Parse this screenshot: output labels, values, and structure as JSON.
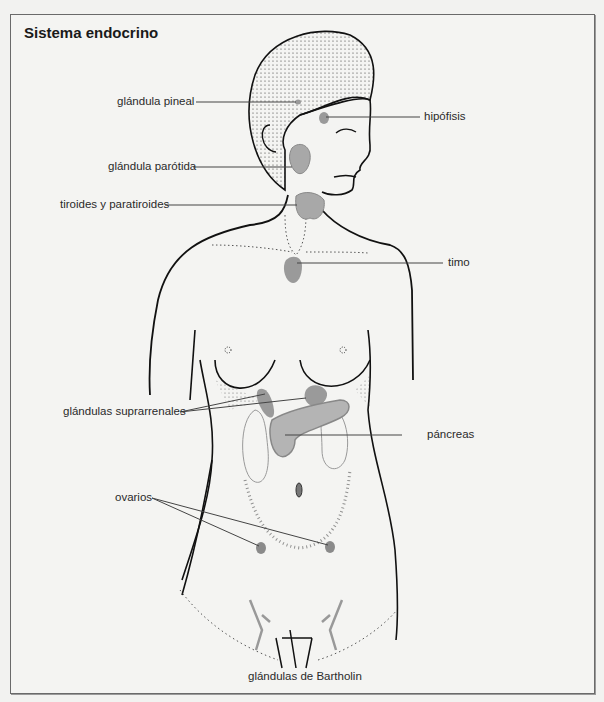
{
  "diagram": {
    "title": "Sistema endocrino",
    "labels": {
      "pineal": "glándula pineal",
      "hipofisis": "hipófisis",
      "parotida": "glándula parótida",
      "tiroides": "tiroides y paratiroides",
      "timo": "timo",
      "suprarrenales": "glándulas suprarrenales",
      "pancreas": "páncreas",
      "ovarios": "ovarios",
      "bartholin": "glándulas de Bartholin"
    },
    "colors": {
      "outline": "#111111",
      "gland_fill": "#9a9a9a",
      "gland_light": "#c8c8c8",
      "leader": "#444444",
      "frame": "#6a6a6a",
      "background": "#f4f4f2"
    }
  }
}
